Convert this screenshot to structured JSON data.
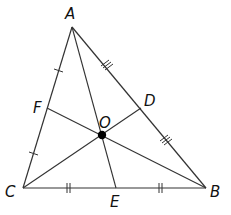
{
  "diagram": {
    "title": "",
    "points": {
      "A": {
        "label": "A"
      },
      "B": {
        "label": "B"
      },
      "C": {
        "label": "C"
      },
      "D": {
        "label": "D"
      },
      "E": {
        "label": "E"
      },
      "F": {
        "label": "F"
      },
      "O": {
        "label": "O"
      }
    },
    "segments": [
      {
        "from": "A",
        "to": "B",
        "kind": "side"
      },
      {
        "from": "B",
        "to": "C",
        "kind": "side"
      },
      {
        "from": "C",
        "to": "A",
        "kind": "side"
      },
      {
        "from": "A",
        "to": "E",
        "kind": "median"
      },
      {
        "from": "B",
        "to": "F",
        "kind": "median"
      },
      {
        "from": "C",
        "to": "D",
        "kind": "median"
      }
    ],
    "congruence_marks": [
      {
        "segment": "CF",
        "ticks": 1
      },
      {
        "segment": "FA",
        "ticks": 1
      },
      {
        "segment": "CE",
        "ticks": 2
      },
      {
        "segment": "EB",
        "ticks": 2
      },
      {
        "segment": "AD",
        "ticks": 3
      },
      {
        "segment": "DB",
        "ticks": 3
      }
    ],
    "centroid": {
      "point": "O",
      "color": "#000000"
    },
    "line_color": "#333333"
  }
}
